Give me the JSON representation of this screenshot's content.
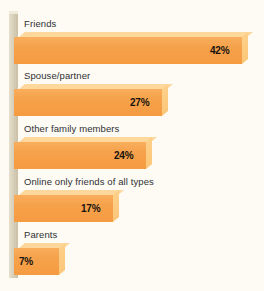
{
  "chart_data": {
    "type": "bar",
    "orientation": "horizontal",
    "title": "",
    "subtitle": "",
    "xlabel": "",
    "ylabel": "",
    "grid": false,
    "legend": null,
    "value_suffix": "%",
    "xlim": [
      0,
      42
    ],
    "categories": [
      "Friends",
      "Spouse/partner",
      "Other family members",
      "Online only friends of all types",
      "Parents"
    ],
    "values": [
      42,
      27,
      24,
      17,
      7
    ],
    "value_labels": [
      "42%",
      "27%",
      "24%",
      "17%",
      "7%"
    ],
    "series": [
      {
        "name": "",
        "values": [
          42,
          27,
          24,
          17,
          7
        ]
      }
    ]
  },
  "style": {
    "background_color": "#fdfbf4",
    "bar_front_color": "#f6a24c",
    "bar_top_color": "#fdd79b",
    "bar_cap_color": "#fbc77a",
    "axis_color": "#d8d0ba",
    "label_color": "#2f2f33",
    "value_color": "#16130f"
  },
  "bars": [
    {
      "label": "Friends",
      "value_label": "42%",
      "row_top": 18,
      "label_top": 0,
      "bar_top": 14,
      "bar_width": 228,
      "bar_height": 27
    },
    {
      "label": "Spouse/partner",
      "value_label": "27%",
      "row_top": 70,
      "label_top": 0,
      "bar_top": 14,
      "bar_width": 148,
      "bar_height": 27
    },
    {
      "label": "Other family members",
      "value_label": "24%",
      "row_top": 123,
      "label_top": 0,
      "bar_top": 14,
      "bar_width": 132,
      "bar_height": 27
    },
    {
      "label": "Online only friends of all types",
      "value_label": "17%",
      "row_top": 176,
      "label_top": 0,
      "bar_top": 14,
      "bar_width": 99,
      "bar_height": 27
    },
    {
      "label": "Parents",
      "value_label": "7%",
      "row_top": 229,
      "label_top": 0,
      "bar_top": 14,
      "bar_width": 45,
      "bar_height": 27
    }
  ]
}
